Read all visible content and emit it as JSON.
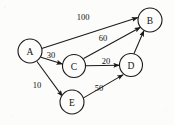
{
  "diagram": {
    "background_color": "#fcfcfb",
    "stroke_color": "#1a1a1a",
    "nodes": [
      {
        "id": "A",
        "label": "A",
        "cx": 30,
        "cy": 51,
        "r": 12
      },
      {
        "id": "B",
        "label": "B",
        "cx": 150,
        "cy": 20,
        "r": 12
      },
      {
        "id": "C",
        "label": "C",
        "cx": 74,
        "cy": 66,
        "r": 11.5
      },
      {
        "id": "D",
        "label": "D",
        "cx": 131,
        "cy": 65,
        "r": 11.5
      },
      {
        "id": "E",
        "label": "E",
        "cx": 72,
        "cy": 102,
        "r": 12
      }
    ],
    "edges": [
      {
        "id": "A-B",
        "from": "A",
        "to": "B",
        "weight": "100",
        "label_x": 83,
        "label_y": 17,
        "x1": 41.7,
        "y1": 48.4,
        "x2": 137.9,
        "y2": 17.5
      },
      {
        "id": "A-C",
        "from": "A",
        "to": "C",
        "weight": "30",
        "label_x": 51,
        "label_y": 55,
        "x1": 40.9,
        "y1": 57.3,
        "x2": 62.6,
        "y2": 64.1
      },
      {
        "id": "A-E",
        "from": "A",
        "to": "E",
        "weight": "10",
        "label_x": 37,
        "label_y": 85,
        "x1": 36.8,
        "y1": 61.3,
        "x2": 62.5,
        "y2": 96.4
      },
      {
        "id": "C-B",
        "from": "C",
        "to": "B",
        "weight": "60",
        "label_x": 103,
        "label_y": 38,
        "x1": 83.6,
        "y1": 58.5,
        "x2": 140.6,
        "y2": 27.2
      },
      {
        "id": "C-D",
        "from": "C",
        "to": "D",
        "weight": "20",
        "label_x": 106,
        "label_y": 61,
        "x1": 85.5,
        "y1": 65.8,
        "x2": 119.5,
        "y2": 65.2
      },
      {
        "id": "E-D",
        "from": "E",
        "to": "D",
        "weight": "50",
        "label_x": 99,
        "label_y": 88,
        "x1": 83.1,
        "y1": 98.1,
        "x2": 123.3,
        "y2": 74.6
      },
      {
        "id": "D-B",
        "from": "D",
        "to": "B",
        "weight": "",
        "label_x": 0,
        "label_y": 0,
        "x1": 133.9,
        "y1": 53.7,
        "x2": 144.0,
        "y2": 30.5
      }
    ]
  }
}
